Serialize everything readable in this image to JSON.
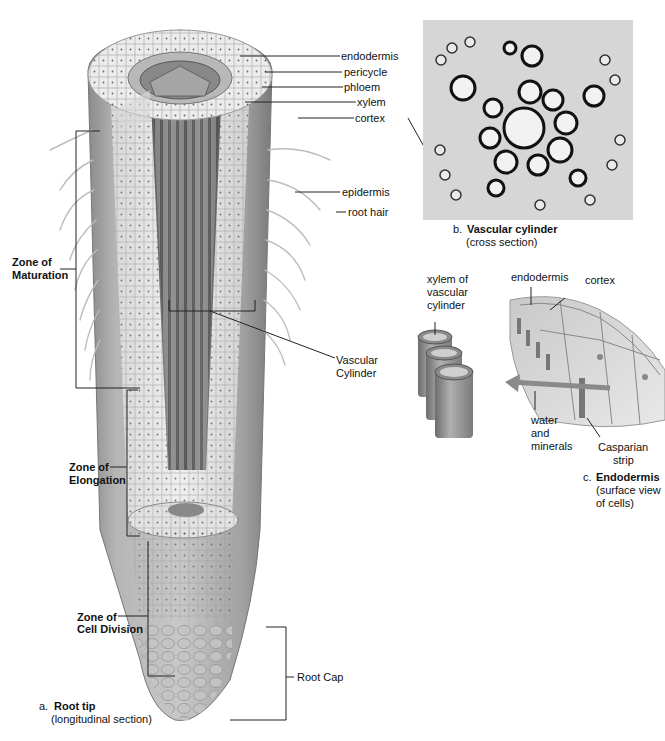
{
  "panel_a": {
    "letter": "a.",
    "title": "Root tip",
    "subtitle": "(longitudinal section)",
    "labels": {
      "endodermis": "endodermis",
      "pericycle": "pericycle",
      "phloem": "phloem",
      "xylem": "xylem",
      "cortex": "cortex",
      "epidermis": "epidermis",
      "root_hair": "root hair",
      "vascular_cylinder_1": "Vascular",
      "vascular_cylinder_2": "Cylinder",
      "root_cap": "Root Cap"
    },
    "zones": {
      "maturation_1": "Zone of",
      "maturation_2": "Maturation",
      "elongation_1": "Zone of",
      "elongation_2": "Elongation",
      "division_1": "Zone of",
      "division_2": "Cell Division"
    }
  },
  "panel_b": {
    "letter": "b.",
    "title": "Vascular cylinder",
    "subtitle": "(cross section)"
  },
  "panel_c": {
    "letter": "c.",
    "title": "Endodermis",
    "subtitle_1": "(surface view",
    "subtitle_2": "of cells)",
    "labels": {
      "xylem_1": "xylem of",
      "xylem_2": "vascular",
      "xylem_3": "cylinder",
      "endodermis": "endodermis",
      "cortex": "cortex",
      "water_1": "water",
      "water_2": "and",
      "water_3": "minerals",
      "casparian_1": "Casparian",
      "casparian_2": "strip"
    }
  }
}
